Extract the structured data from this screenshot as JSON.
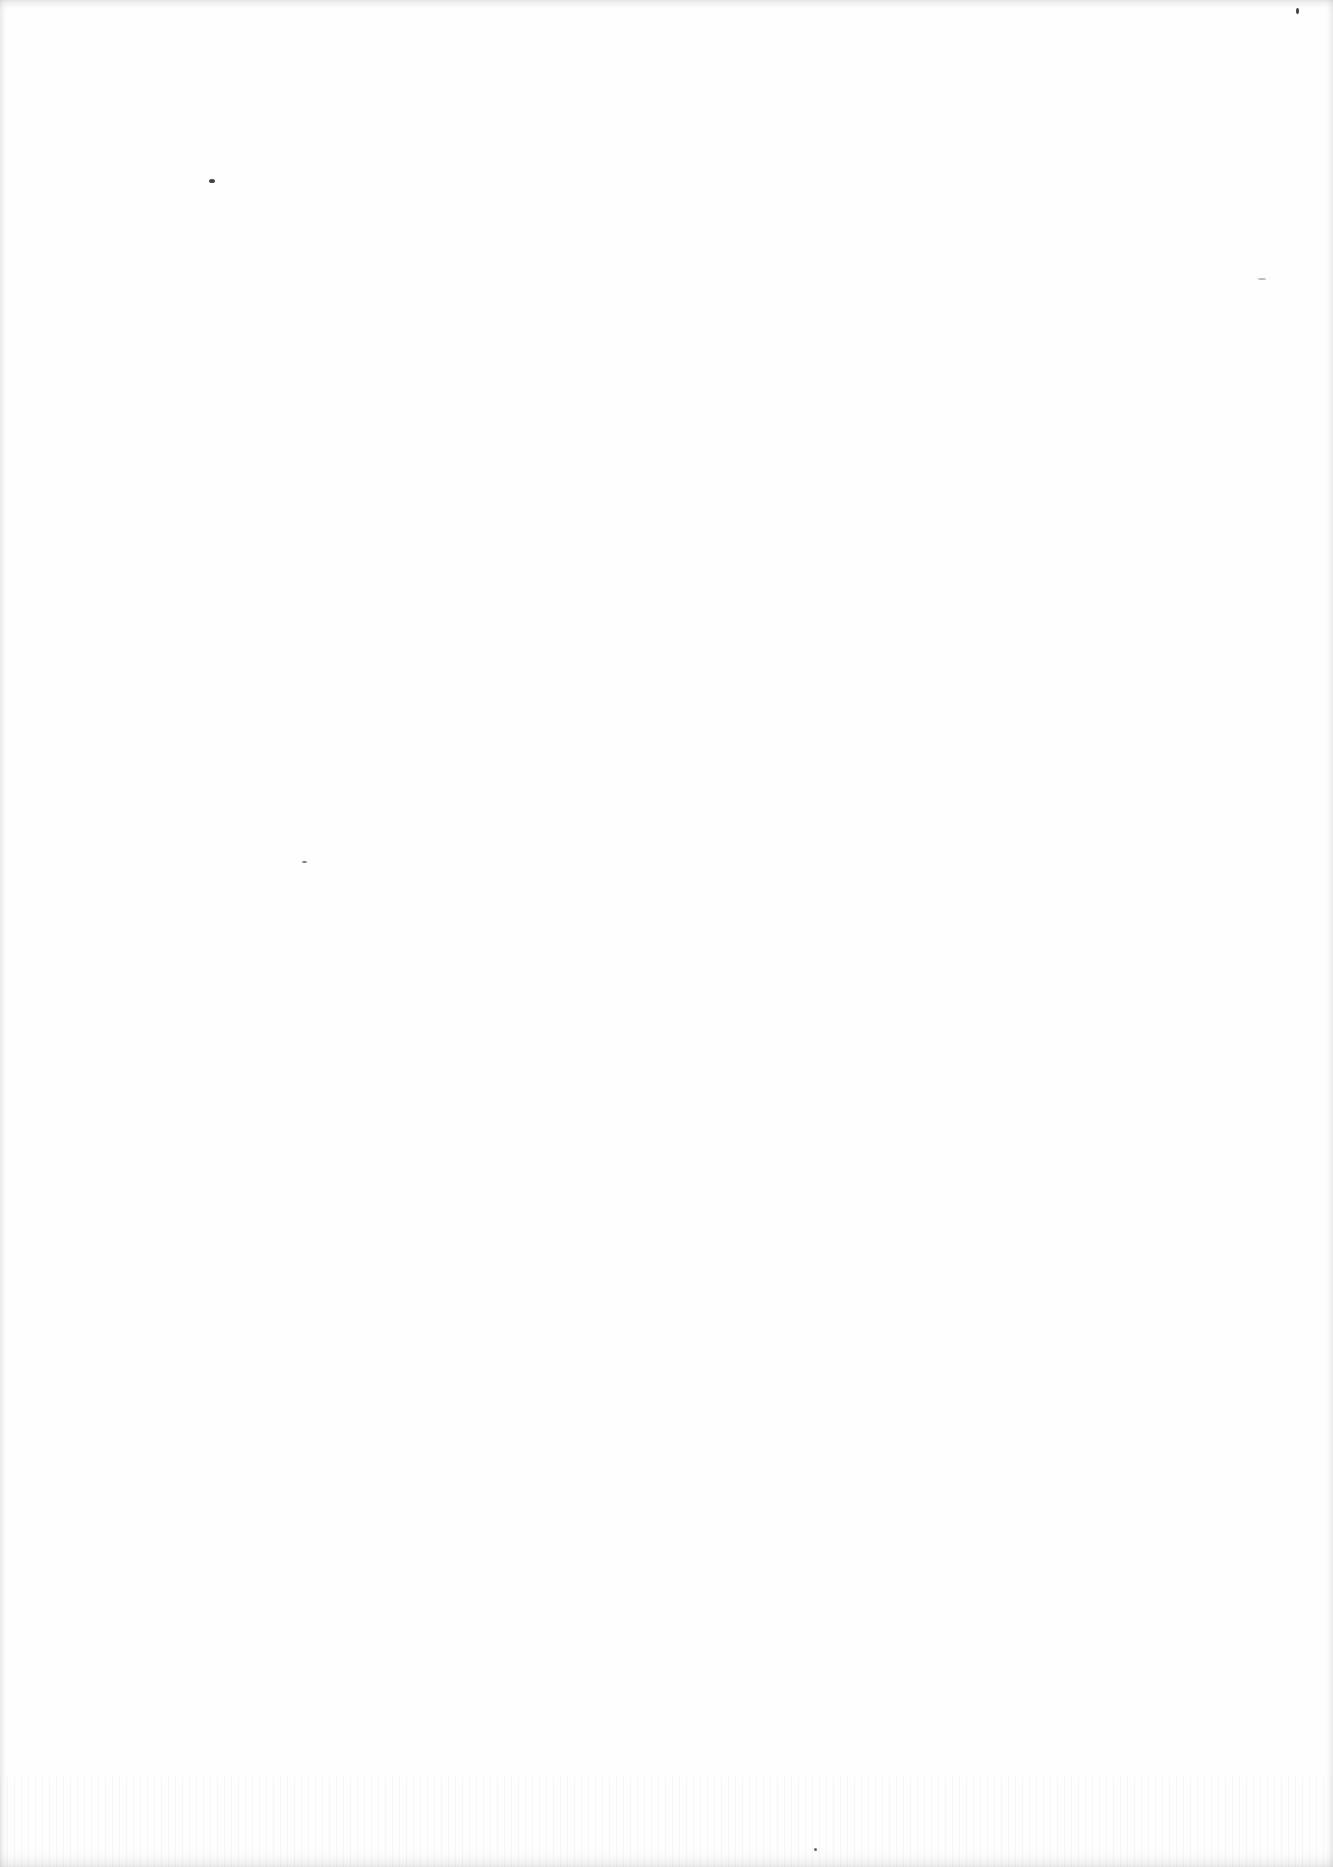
{
  "document": {
    "type": "blank scanned page",
    "text": ""
  },
  "colors": {
    "background": "#fefefe",
    "speck": "#444444"
  }
}
